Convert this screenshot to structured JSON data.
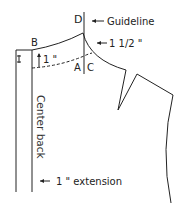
{
  "diagram": {
    "type": "sewing pattern draft - back bodice neckline",
    "labels": {
      "D": "D",
      "B": "B",
      "A": "A",
      "C": "C",
      "guideline": "Guideline",
      "one_half_inch": "1 1/2 \"",
      "one_inch": "1 \"",
      "center_back": "Center back",
      "extension": "1 \" extension"
    },
    "colors": {
      "line": "#222222",
      "background": "#ffffff"
    }
  }
}
